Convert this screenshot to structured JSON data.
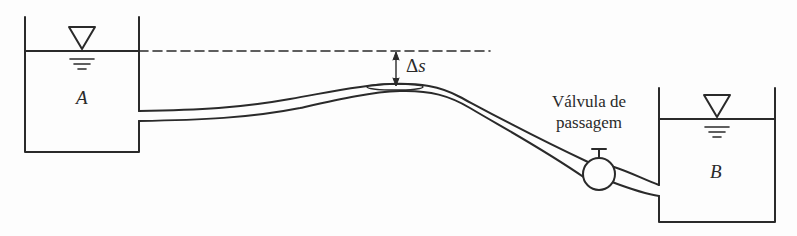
{
  "diagram": {
    "type": "hydraulic siphon schematic",
    "tanks": [
      {
        "id": "A",
        "label": "A",
        "side": "left"
      },
      {
        "id": "B",
        "label": "B",
        "side": "right"
      }
    ],
    "free_surface_symbol": "triangle-water-level",
    "reference_line": "dashed horizontal line at level of tank A free surface",
    "dimension": {
      "symbol": "Δ",
      "variable": "s",
      "label": "Δs"
    },
    "valve": {
      "label_line1": "Válvula de",
      "label_line2": "passagem"
    },
    "colors": {
      "stroke": "#2a2a2a",
      "background": "#fdfdfd"
    }
  }
}
